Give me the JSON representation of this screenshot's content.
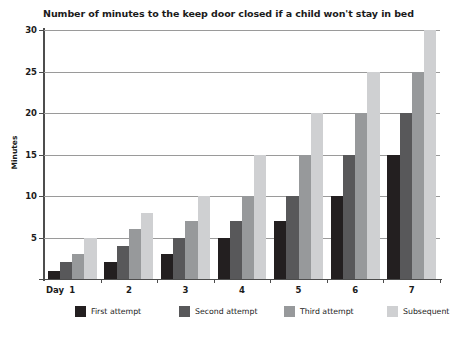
{
  "chart_data": {
    "type": "bar",
    "title": "Number of minutes to the keep door closed if a child won't stay in bed",
    "xlabel": "Day",
    "ylabel": "Minutes",
    "categories": [
      "1",
      "2",
      "3",
      "4",
      "5",
      "6",
      "7"
    ],
    "ylim": [
      0,
      30
    ],
    "yticks": [
      0,
      5,
      10,
      15,
      20,
      25,
      30
    ],
    "ytick_labels": [
      "",
      "5",
      "10",
      "15",
      "20",
      "25",
      "30"
    ],
    "grid": true,
    "legend_position": "bottom",
    "series": [
      {
        "name": "First attempt",
        "color": "#231f20",
        "values": [
          1,
          2,
          3,
          5,
          7,
          10,
          15
        ]
      },
      {
        "name": "Second attempt",
        "color": "#58585a",
        "values": [
          2,
          4,
          5,
          7,
          10,
          15,
          20
        ]
      },
      {
        "name": "Third attempt",
        "color": "#97999b",
        "values": [
          3,
          6,
          7,
          10,
          15,
          20,
          25
        ]
      },
      {
        "name": "Subsequent",
        "color": "#cfd0d2",
        "values": [
          5,
          8,
          10,
          15,
          20,
          25,
          30
        ]
      }
    ]
  }
}
